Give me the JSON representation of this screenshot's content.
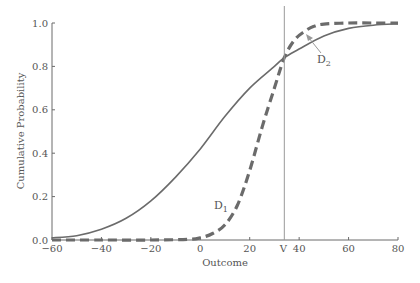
{
  "chart_data": {
    "type": "line",
    "title": "",
    "xlabel": "Outcome",
    "ylabel": "Cumulative Probability",
    "xlim": [
      -60,
      80
    ],
    "ylim": [
      0.0,
      1.0
    ],
    "x_ticks": [
      "-60",
      "-40",
      "-20",
      "0",
      "20",
      "40",
      "60",
      "80"
    ],
    "x_tick_values": [
      -60,
      -40,
      -20,
      0,
      20,
      40,
      60,
      80
    ],
    "y_ticks": [
      "0.0",
      "0.2",
      "0.4",
      "0.6",
      "0.8",
      "1.0"
    ],
    "y_tick_values": [
      0.0,
      0.2,
      0.4,
      0.6,
      0.8,
      1.0
    ],
    "grid": false,
    "legend": "none",
    "series": [
      {
        "name": "D1",
        "label_main": "D",
        "label_sub": "1",
        "style": "dashed",
        "color": "#6b6b6b",
        "x": [
          -60,
          -40,
          -20,
          -5,
          0,
          5,
          10,
          15,
          20,
          25,
          30,
          34,
          38,
          42,
          46,
          50,
          60,
          70,
          80
        ],
        "y": [
          0.0,
          0.0,
          0.0,
          0.003,
          0.01,
          0.03,
          0.07,
          0.16,
          0.32,
          0.52,
          0.7,
          0.84,
          0.92,
          0.96,
          0.985,
          0.995,
          1.0,
          1.0,
          1.0
        ]
      },
      {
        "name": "D2",
        "label_main": "D",
        "label_sub": "2",
        "style": "solid",
        "color": "#6b6b6b",
        "x": [
          -60,
          -50,
          -40,
          -30,
          -20,
          -10,
          0,
          10,
          20,
          30,
          34,
          40,
          50,
          60,
          70,
          80
        ],
        "y": [
          0.01,
          0.02,
          0.05,
          0.1,
          0.18,
          0.29,
          0.42,
          0.57,
          0.7,
          0.8,
          0.84,
          0.88,
          0.94,
          0.975,
          0.99,
          0.996
        ]
      }
    ],
    "annotations": [
      {
        "type": "vline",
        "x": 34,
        "label": "V"
      },
      {
        "type": "text",
        "text": "D1",
        "x": 16,
        "y": 0.16
      },
      {
        "type": "arrow-label",
        "text": "D2",
        "x": 46,
        "y": 0.84,
        "arrow_to": [
          42,
          0.93
        ]
      }
    ]
  },
  "labels": {
    "xlabel": "Outcome",
    "ylabel": "Cumulative Probability",
    "vline": "V",
    "d1_main": "D",
    "d1_sub": "1",
    "d2_main": "D",
    "d2_sub": "2"
  }
}
